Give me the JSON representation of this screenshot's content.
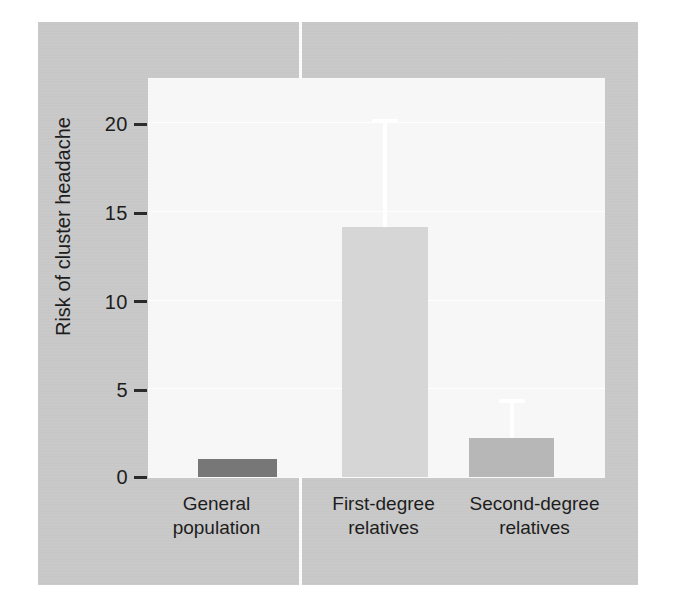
{
  "chart_data": {
    "type": "bar",
    "title": "",
    "xlabel": "",
    "ylabel": "Risk of cluster headache",
    "categories": [
      "General population",
      "First-degree relatives",
      "Second-degree relatives"
    ],
    "category_lines": [
      [
        "General",
        "population"
      ],
      [
        "First-degree",
        "relatives"
      ],
      [
        "Second-degree",
        "relatives"
      ]
    ],
    "values": [
      1.0,
      14.1,
      2.2
    ],
    "error_high": [
      null,
      20.2,
      4.4
    ],
    "error_low": [
      null,
      null,
      null
    ],
    "ylim": [
      0,
      22.5
    ],
    "yticks": [
      0,
      5,
      10,
      15,
      20
    ],
    "ytick_labels": [
      "0",
      "5",
      "10",
      "15",
      "20"
    ],
    "grid": true,
    "grid_color": "#ffffff",
    "legend": null,
    "bar_colors": [
      "#777777",
      "#d6d6d6",
      "#b7b7b7"
    ],
    "errorbar_color": "#ffffff",
    "figure_background": "#c9c9c9",
    "plot_background": "#f7f7f7",
    "text_color": "#1d1d1d"
  },
  "axis": {
    "y_title": "Risk of cluster headache",
    "tick_0": "0",
    "tick_5": "5",
    "tick_10": "10",
    "tick_15": "15",
    "tick_20": "20"
  },
  "categories": {
    "c0_l1": "General",
    "c0_l2": "population",
    "c1_l1": "First-degree",
    "c1_l2": "relatives",
    "c2_l1": "Second-degree",
    "c2_l2": "relatives"
  }
}
